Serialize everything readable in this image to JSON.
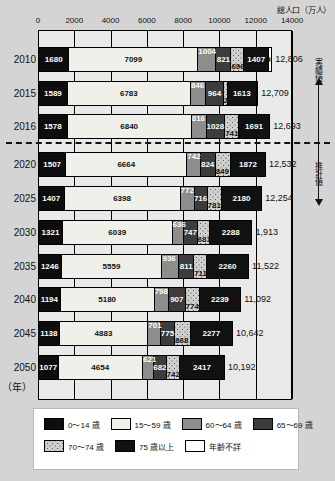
{
  "chart_data": {
    "type": "bar",
    "orientation": "horizontal",
    "stacked": true,
    "title": "",
    "xlabel": "総人口（万人）",
    "ylabel": "（年）",
    "xlim": [
      0,
      14000
    ],
    "xticks": [
      "0",
      "2000",
      "4000",
      "6000",
      "8000",
      "10000",
      "12000",
      "14000"
    ],
    "grid": true,
    "legend_position": "bottom",
    "categories": [
      "2010",
      "2015",
      "2016",
      "2020",
      "2025",
      "2030",
      "2035",
      "2040",
      "2045",
      "2050"
    ],
    "series": [
      {
        "name": "0～14歳",
        "color": "#0d0d0d",
        "values": [
          1680,
          1589,
          1578,
          1507,
          1407,
          1321,
          1246,
          1194,
          1138,
          1077
        ]
      },
      {
        "name": "15～59歳",
        "color": "#f0f0ea",
        "values": [
          7099,
          6783,
          6840,
          6664,
          6398,
          6039,
          5559,
          5180,
          4883,
          4654
        ]
      },
      {
        "name": "60～64歳",
        "color": "#8d8d8d",
        "values": [
          1004,
          846,
          816,
          742,
          772,
          636,
          936,
          798,
          701,
          621
        ]
      },
      {
        "name": "65～69歳",
        "color": "#3c3c3c",
        "values": [
          821,
          964,
          1028,
          824,
          716,
          747,
          811,
          907,
          775,
          682
        ]
      },
      {
        "name": "70～74歳",
        "color": "#cfcfcf",
        "values": [
          696,
          220,
          741,
          849,
          781,
          681,
          711,
          774,
          868,
          742
        ]
      },
      {
        "name": "75歳以上",
        "color": "#111111",
        "values": [
          1407,
          1613,
          1691,
          1872,
          2180,
          2288,
          2260,
          2239,
          2277,
          2417
        ]
      },
      {
        "name": "年齢不詳",
        "color": "#ffffff",
        "values": [
          98,
          14,
          0,
          0,
          0,
          0,
          0,
          0,
          0,
          0
        ]
      }
    ],
    "totals": [
      "12,806",
      "12,709",
      "12,693",
      "12,532",
      "12,254",
      "1,913",
      "11,522",
      "11,092",
      "10,642",
      "10,192"
    ],
    "annotations": {
      "actual_label": "実績値",
      "estimate_label": "推計値",
      "divider_after_category": "2016"
    }
  },
  "axis": {
    "unit_label": "総人口（万人）",
    "year_unit": "（年）"
  },
  "legend": {
    "items": [
      {
        "label": "0～14 歳",
        "swatch": "c0"
      },
      {
        "label": "15～59 歳",
        "swatch": "c1"
      },
      {
        "label": "60～64 歳",
        "swatch": "c2"
      },
      {
        "label": "65～69 歳",
        "swatch": "c3"
      },
      {
        "label": "70～74 歳",
        "swatch": "c4"
      },
      {
        "label": "75 歳以上",
        "swatch": "c5"
      },
      {
        "label": "年齢不詳",
        "swatch": "c6"
      }
    ]
  }
}
